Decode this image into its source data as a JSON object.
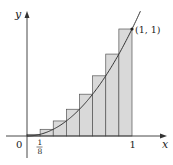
{
  "figure": {
    "y_axis_label": "y",
    "x_axis_label": "x",
    "origin_label": "0",
    "tick_label_one": "1",
    "tick_label_eighth_num": "1",
    "tick_label_eighth_den": "8",
    "point_label": "(1, 1)"
  },
  "colors": {
    "axis": "#333333",
    "curve": "#333333",
    "rect_fill": "#d9d9d9",
    "rect_stroke": "#555555",
    "point": "#222222"
  },
  "chart_data": {
    "type": "area",
    "function": "y = x^2",
    "x_range": [
      0,
      1
    ],
    "n_rectangles": 8,
    "rectangle_width": 0.125,
    "endpoint_rule": "right",
    "rectangles": [
      {
        "x0": 0.0,
        "x1": 0.125,
        "height": 0.015625
      },
      {
        "x0": 0.125,
        "x1": 0.25,
        "height": 0.0625
      },
      {
        "x0": 0.25,
        "x1": 0.375,
        "height": 0.140625
      },
      {
        "x0": 0.375,
        "x1": 0.5,
        "height": 0.25
      },
      {
        "x0": 0.5,
        "x1": 0.625,
        "height": 0.390625
      },
      {
        "x0": 0.625,
        "x1": 0.75,
        "height": 0.5625
      },
      {
        "x0": 0.75,
        "x1": 0.875,
        "height": 0.765625
      },
      {
        "x0": 0.875,
        "x1": 1.0,
        "height": 1.0
      }
    ],
    "marked_point": {
      "x": 1,
      "y": 1,
      "label": "(1, 1)"
    },
    "x_ticks": [
      "0",
      "1/8",
      "1"
    ],
    "xlabel": "x",
    "ylabel": "y"
  }
}
